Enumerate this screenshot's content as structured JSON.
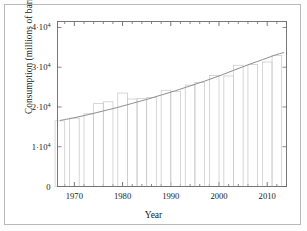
{
  "figure": {
    "name": "world-oil-consumption-chart",
    "xlabel": "Year",
    "ylabel": "Consumption (millions of barrels)"
  },
  "axis": {
    "y_ticks": [
      {
        "value": 0,
        "mantissa": "0",
        "has_power": false,
        "base": "",
        "exp": ""
      },
      {
        "value": 10000,
        "mantissa": "1",
        "has_power": true,
        "base": "10",
        "exp": "4"
      },
      {
        "value": 20000,
        "mantissa": "2",
        "has_power": true,
        "base": "10",
        "exp": "4"
      },
      {
        "value": 30000,
        "mantissa": "3",
        "has_power": true,
        "base": "10",
        "exp": "4"
      },
      {
        "value": 40000,
        "mantissa": "4",
        "has_power": true,
        "base": "10",
        "exp": "4"
      }
    ],
    "x_ticks_major": [
      "1970",
      "1980",
      "1990",
      "2000",
      "2010"
    ],
    "x_ticks_major_values": [
      1970,
      1980,
      1990,
      2000,
      2010
    ],
    "x_minor_step": 2,
    "xlim": [
      1966.5,
      2014.0
    ],
    "ylim": [
      0,
      41500
    ],
    "grid": false,
    "frame": true,
    "tick_direction": "in"
  },
  "style": {
    "bar_stroke": "#c9c9c9",
    "bar_fill": "none",
    "line_color": "#8f8f8f",
    "axis_color": "#6a6a6a",
    "text_color": "#1a1a1a",
    "frame_color": "#b9b9b9",
    "background": "#ffffff"
  },
  "chart_data": {
    "type": "bar",
    "title": "",
    "subtitle": "",
    "xlabel": "Year",
    "ylabel": "Consumption (millions of barrels)",
    "xlim": [
      1966.5,
      2014.0
    ],
    "ylim": [
      0,
      41500
    ],
    "grid": false,
    "legend": null,
    "legend_position": "none",
    "annotations": [],
    "bar_width_years": 2.0,
    "categories": [
      1967,
      1970,
      1973,
      1975,
      1977,
      1980,
      1982,
      1984,
      1986,
      1989,
      1991,
      1994,
      1996,
      1999,
      2002,
      2004,
      2007,
      2010,
      2012
    ],
    "values": [
      16500,
      17200,
      18300,
      20900,
      21300,
      23500,
      22000,
      22100,
      22400,
      24200,
      23900,
      25500,
      26200,
      27900,
      27800,
      30500,
      30700,
      31300,
      33000
    ],
    "series": [
      {
        "name": "Consumption (bars)",
        "type": "bar",
        "values": [
          16500,
          17200,
          18300,
          20900,
          21300,
          23500,
          22000,
          22100,
          22400,
          24200,
          23900,
          25500,
          26200,
          27900,
          27800,
          30500,
          30700,
          31300,
          33000
        ]
      },
      {
        "name": "Trend",
        "type": "line",
        "x": [
          1967,
          1970,
          1973,
          1976,
          1979,
          1982,
          1985,
          1988,
          1991,
          1994,
          1997,
          2000,
          2003,
          2006,
          2009,
          2012,
          2013.5
        ],
        "values": [
          16600,
          17300,
          18100,
          19000,
          19900,
          20900,
          21900,
          23000,
          24100,
          25300,
          26500,
          27800,
          29200,
          30600,
          31900,
          33200,
          33700
        ]
      }
    ]
  }
}
